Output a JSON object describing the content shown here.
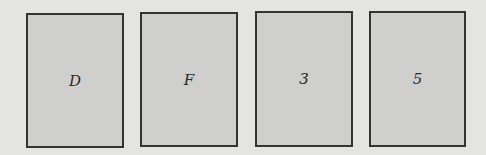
{
  "cards": [
    {
      "label": "D"
    },
    {
      "label": "F"
    },
    {
      "label": "3"
    },
    {
      "label": "5"
    }
  ],
  "colors": {
    "background": "#e4e4e2",
    "card_fill": "#cfcfcd",
    "card_border": "#333333",
    "text": "#2a2a2a"
  }
}
